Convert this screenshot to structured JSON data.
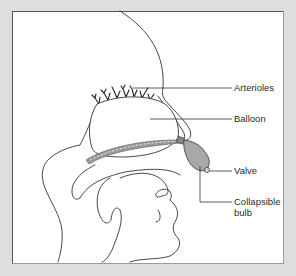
{
  "figure": {
    "background_color": "#dedede",
    "panel_color": "#ffffff",
    "line_color": "#333333",
    "balloon_fill": "#ffffff",
    "bulb_fill": "#a8a8a8",
    "catheter_fill": "#9a9a9a"
  },
  "labels": {
    "arterioles": "Arterioles",
    "balloon": "Balloon",
    "valve": "Valve",
    "collapsible_bulb_line1": "Collapsible",
    "collapsible_bulb_line2": "bulb"
  }
}
